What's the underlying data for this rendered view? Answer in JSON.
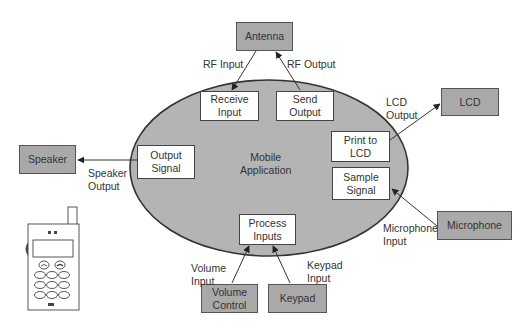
{
  "diagram": {
    "center": {
      "label_line1": "Mobile",
      "label_line2": "Application"
    },
    "colors": {
      "ellipse_fill": "#b4b4b4",
      "external_box": "#a9a9a9",
      "internal_box": "#ffffff",
      "stroke": "#333333"
    },
    "external_entities": {
      "antenna": "Antenna",
      "lcd": "LCD",
      "microphone": "Microphone",
      "speaker": "Speaker",
      "volume_control_l1": "Volume",
      "volume_control_l2": "Control",
      "keypad": "Keypad"
    },
    "processes": {
      "receive_input_l1": "Receive",
      "receive_input_l2": "Input",
      "send_output_l1": "Send",
      "send_output_l2": "Output",
      "print_lcd_l1": "Print to",
      "print_lcd_l2": "LCD",
      "sample_signal_l1": "Sample",
      "sample_signal_l2": "Signal",
      "output_signal_l1": "Output",
      "output_signal_l2": "Signal",
      "process_inputs_l1": "Process",
      "process_inputs_l2": "Inputs"
    },
    "flows": {
      "rf_input": "RF Input",
      "rf_output": "RF Output",
      "lcd_output_l1": "LCD",
      "lcd_output_l2": "Output",
      "microphone_input_l1": "Microphone",
      "microphone_input_l2": "Input",
      "speaker_output_l1": "Speaker",
      "speaker_output_l2": "Output",
      "volume_input_l1": "Volume",
      "volume_input_l2": "Input",
      "keypad_input_l1": "Keypad",
      "keypad_input_l2": "Input"
    },
    "icons": {
      "phone": "mobile-phone-illustration"
    }
  }
}
